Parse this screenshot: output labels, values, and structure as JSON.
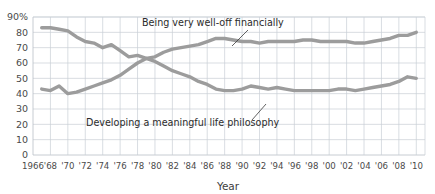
{
  "chart_data": {
    "type": "line",
    "title": "",
    "xlabel": "Year",
    "ylabel": "",
    "xlim": [
      1966,
      2011
    ],
    "ylim": [
      0,
      90
    ],
    "grid": true,
    "legend_position": "inline-annotations",
    "y_ticks": [
      "0",
      "10",
      "20",
      "30",
      "40",
      "50",
      "60",
      "70",
      "80",
      "90%"
    ],
    "y_tick_values": [
      0,
      10,
      20,
      30,
      40,
      50,
      60,
      70,
      80,
      90
    ],
    "x_ticks": [
      "1966",
      "'68",
      "'70",
      "'72",
      "'74",
      "'76",
      "'78",
      "'80",
      "'82",
      "'84",
      "'86",
      "'88",
      "'90",
      "'92",
      "'94",
      "'96",
      "'98",
      "'00",
      "'02",
      "'04",
      "'06",
      "'08",
      "'10"
    ],
    "x_tick_values": [
      1966,
      1968,
      1970,
      1972,
      1974,
      1976,
      1978,
      1980,
      1982,
      1984,
      1986,
      1988,
      1990,
      1992,
      1994,
      1996,
      1998,
      2000,
      2002,
      2004,
      2006,
      2008,
      2010
    ],
    "line_color": "#9c9c9c",
    "grid_color": "#c9cfd6",
    "series": [
      {
        "name": "Being very well-off financially",
        "annotation": "Being very well-off financially",
        "x": [
          1967,
          1968,
          1969,
          1970,
          1971,
          1972,
          1973,
          1974,
          1975,
          1976,
          1977,
          1978,
          1979,
          1980,
          1981,
          1982,
          1983,
          1984,
          1985,
          1986,
          1987,
          1988,
          1989,
          1990,
          1991,
          1992,
          1993,
          1994,
          1995,
          1996,
          1997,
          1998,
          1999,
          2000,
          2001,
          2002,
          2003,
          2004,
          2005,
          2006,
          2007,
          2008,
          2009,
          2010
        ],
        "values": [
          43,
          42,
          45,
          40,
          41,
          43,
          45,
          47,
          49,
          52,
          56,
          60,
          63,
          64,
          67,
          69,
          70,
          71,
          72,
          74,
          76,
          76,
          75,
          74,
          74,
          73,
          74,
          74,
          74,
          74,
          75,
          75,
          74,
          74,
          74,
          74,
          73,
          73,
          74,
          75,
          76,
          78,
          78,
          80
        ]
      },
      {
        "name": "Developing a meaningful life philosophy",
        "annotation": "Developing a meaningful life philosophy",
        "x": [
          1967,
          1968,
          1969,
          1970,
          1971,
          1972,
          1973,
          1974,
          1975,
          1976,
          1977,
          1978,
          1979,
          1980,
          1981,
          1982,
          1983,
          1984,
          1985,
          1986,
          1987,
          1988,
          1989,
          1990,
          1991,
          1992,
          1993,
          1994,
          1995,
          1996,
          1997,
          1998,
          1999,
          2000,
          2001,
          2002,
          2003,
          2004,
          2005,
          2006,
          2007,
          2008,
          2009,
          2010
        ],
        "values": [
          83,
          83,
          82,
          81,
          77,
          74,
          73,
          70,
          72,
          68,
          64,
          65,
          63,
          61,
          58,
          55,
          53,
          51,
          48,
          46,
          43,
          42,
          42,
          43,
          45,
          44,
          43,
          44,
          43,
          42,
          42,
          42,
          42,
          42,
          43,
          43,
          42,
          43,
          44,
          45,
          46,
          48,
          51,
          50
        ]
      }
    ],
    "annotations": [
      {
        "text": "Being very well-off financially",
        "text_x": 142,
        "text_y": 26,
        "leader": [
          [
            248,
            30
          ],
          [
            232,
            46
          ]
        ]
      },
      {
        "text": "Developing a meaningful life philosophy",
        "text_x": 86,
        "text_y": 126,
        "leader": [
          [
            252,
            120
          ],
          [
            266,
            104
          ]
        ]
      }
    ]
  }
}
